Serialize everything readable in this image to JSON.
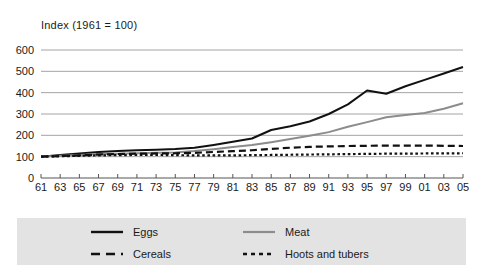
{
  "chart_data": {
    "type": "line",
    "title": "Index (1961 = 100)",
    "xlabel": "",
    "ylabel": "Index (1961 = 100)",
    "ylim": [
      0,
      600
    ],
    "xlim": [
      1961,
      2005
    ],
    "grid": true,
    "legend_position": "bottom",
    "ytick_labels": [
      "0",
      "100",
      "200",
      "300",
      "400",
      "500",
      "600"
    ],
    "ytick_values": [
      0,
      100,
      200,
      300,
      400,
      500,
      600
    ],
    "xtick_labels": [
      "61",
      "63",
      "65",
      "67",
      "69",
      "71",
      "73",
      "75",
      "77",
      "79",
      "81",
      "83",
      "85",
      "87",
      "89",
      "91",
      "93",
      "95",
      "97",
      "99",
      "01",
      "03",
      "05"
    ],
    "x": [
      1961,
      1963,
      1965,
      1967,
      1969,
      1971,
      1973,
      1975,
      1977,
      1979,
      1981,
      1983,
      1985,
      1987,
      1989,
      1991,
      1993,
      1995,
      1997,
      1999,
      2001,
      2003,
      2005
    ],
    "series": [
      {
        "name": "Eggs",
        "color": "#111111",
        "style": "solid",
        "values": [
          100,
          108,
          115,
          122,
          126,
          130,
          133,
          136,
          142,
          155,
          170,
          185,
          225,
          243,
          265,
          300,
          345,
          410,
          395,
          430,
          460,
          490,
          520
        ]
      },
      {
        "name": "Meat",
        "color": "#8c8c8c",
        "style": "solid",
        "values": [
          100,
          104,
          108,
          112,
          114,
          116,
          118,
          120,
          126,
          135,
          145,
          155,
          168,
          183,
          198,
          215,
          240,
          262,
          285,
          295,
          305,
          325,
          350
        ]
      },
      {
        "name": "Cereals",
        "color": "#111111",
        "style": "dashed",
        "values": [
          100,
          103,
          106,
          110,
          112,
          114,
          115,
          116,
          118,
          122,
          126,
          130,
          136,
          142,
          146,
          148,
          150,
          151,
          152,
          152,
          152,
          151,
          150
        ]
      },
      {
        "name": "Hoots and tubers",
        "color": "#111111",
        "style": "dotted",
        "values": [
          100,
          102,
          104,
          106,
          107,
          108,
          108,
          107,
          106,
          106,
          106,
          107,
          108,
          109,
          110,
          111,
          112,
          113,
          114,
          114,
          115,
          115,
          116
        ]
      }
    ]
  },
  "legend": {
    "entries": [
      {
        "label": "Eggs"
      },
      {
        "label": "Meat"
      },
      {
        "label": "Cereals"
      },
      {
        "label": "Hoots and tubers"
      }
    ]
  },
  "colors": {
    "eggs": "#111111",
    "meat": "#8c8c8c",
    "cereals": "#111111",
    "roots": "#111111",
    "grid": "#9a9a9a",
    "legend_background": "#e3e3e3",
    "text": "#1a1a1a"
  }
}
